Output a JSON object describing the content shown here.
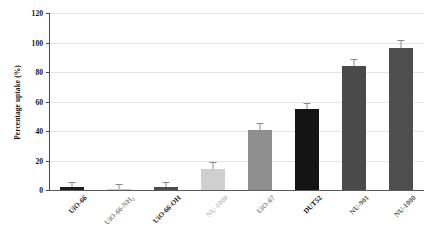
{
  "chart_data": {
    "type": "bar",
    "title": "",
    "xlabel": "",
    "ylabel": "Percentage uptake (%)",
    "ylim": [
      0,
      120
    ],
    "ytick_values": [
      120,
      100,
      80,
      60,
      40,
      20,
      0
    ],
    "ytick_labels": [
      "120",
      "100",
      "80",
      "60",
      "40",
      "20",
      "0"
    ],
    "grid": "horizontal",
    "legend": "none",
    "categories": [
      "UiO-66",
      "UiO-66-NH2",
      "UiO-66-OH",
      "NU-1000",
      "UiO-67",
      "DUT52",
      "NU-901",
      "NU-1000"
    ],
    "values": [
      2,
      1,
      2,
      14,
      41,
      55,
      84,
      96
    ],
    "errors": [
      0.5,
      0.5,
      0.5,
      2,
      2,
      1.5,
      2,
      3
    ],
    "bar_colors": [
      "#1f1f1f",
      "#c9c9c9",
      "#4b4b4b",
      "#cfcfcf",
      "#8f8f8f",
      "#141414",
      "#4a4a4a",
      "#4e4e4e"
    ],
    "label_colors": [
      "#2a2a2a",
      "#8d8d8d",
      "#2a2a2a",
      "#c2c2c2",
      "#8d8d8d",
      "#101010",
      "#5a5a5a",
      "#5a5a5a"
    ],
    "label_weights": [
      "bold",
      "bold",
      "bold",
      "bold",
      "bold",
      "bold",
      "bold",
      "bold"
    ],
    "grid_color": "#e4e4e4",
    "axis_color": "#4a4a4a",
    "error_bar_color": "#8a8a8a"
  },
  "axis": {
    "y_title": "Percentage uptake (%)"
  },
  "labels": {
    "cat_0_main": "UiO-66",
    "cat_0_sub": "",
    "cat_1_main": "UiO-66-NH",
    "cat_1_sub": "2",
    "cat_2_main": "UiO-66-OH",
    "cat_2_sub": "",
    "cat_3_main": "NU-1000",
    "cat_3_sub": "",
    "cat_4_main": "UiO-67",
    "cat_4_sub": "",
    "cat_5_main": "DUT52",
    "cat_5_sub": "",
    "cat_6_main": "NU-901",
    "cat_6_sub": "",
    "cat_7_main": "NU-1000",
    "cat_7_sub": ""
  }
}
